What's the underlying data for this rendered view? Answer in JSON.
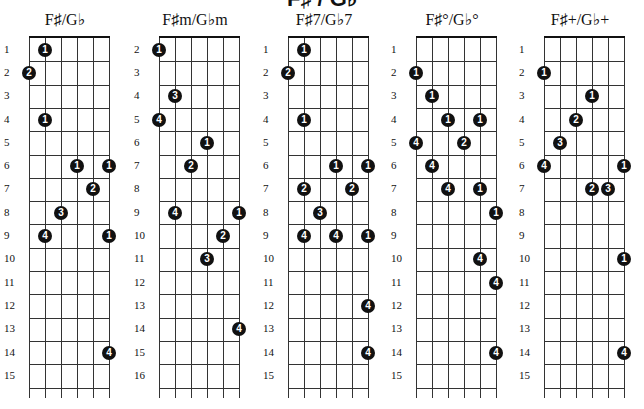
{
  "page": {
    "heading_cut": "F♯ / G♭"
  },
  "charts": [
    {
      "title": "F♯/G♭",
      "left": 0,
      "board_left": 29,
      "start_fret": 1,
      "fret_labels": [
        "1",
        "2",
        "3",
        "4",
        "5",
        "6",
        "7",
        "8",
        "9",
        "10",
        "11",
        "12",
        "13",
        "14",
        "15"
      ],
      "dots": [
        {
          "fret": 1,
          "string": 1,
          "finger": "1"
        },
        {
          "fret": 2,
          "string": 0,
          "finger": "2"
        },
        {
          "fret": 4,
          "string": 1,
          "finger": "1"
        },
        {
          "fret": 6,
          "string": 3,
          "finger": "1"
        },
        {
          "fret": 6,
          "string": 5,
          "finger": "1"
        },
        {
          "fret": 7,
          "string": 4,
          "finger": "2"
        },
        {
          "fret": 8,
          "string": 2,
          "finger": "3"
        },
        {
          "fret": 9,
          "string": 1,
          "finger": "4"
        },
        {
          "fret": 9,
          "string": 5,
          "finger": "1"
        },
        {
          "fret": 14,
          "string": 5,
          "finger": "4"
        }
      ]
    },
    {
      "title": "F♯m/G♭m",
      "left": 130,
      "board_left": 159,
      "start_fret": 2,
      "fret_labels": [
        "2",
        "3",
        "4",
        "5",
        "6",
        "7",
        "8",
        "9",
        "10",
        "11",
        "12",
        "13",
        "14",
        "15",
        "16"
      ],
      "dots": [
        {
          "fret": 2,
          "string": 0,
          "finger": "1"
        },
        {
          "fret": 4,
          "string": 1,
          "finger": "3"
        },
        {
          "fret": 5,
          "string": 0,
          "finger": "4"
        },
        {
          "fret": 6,
          "string": 3,
          "finger": "1"
        },
        {
          "fret": 7,
          "string": 2,
          "finger": "2"
        },
        {
          "fret": 9,
          "string": 1,
          "finger": "4"
        },
        {
          "fret": 9,
          "string": 5,
          "finger": "1"
        },
        {
          "fret": 10,
          "string": 4,
          "finger": "2"
        },
        {
          "fret": 11,
          "string": 3,
          "finger": "3"
        },
        {
          "fret": 14,
          "string": 5,
          "finger": "4"
        }
      ]
    },
    {
      "title": "F♯7/G♭7",
      "left": 259,
      "board_left": 288,
      "start_fret": 1,
      "fret_labels": [
        "1",
        "2",
        "3",
        "4",
        "5",
        "6",
        "7",
        "8",
        "9",
        "10",
        "11",
        "12",
        "13",
        "14",
        "15"
      ],
      "dots": [
        {
          "fret": 1,
          "string": 1,
          "finger": "1"
        },
        {
          "fret": 2,
          "string": 0,
          "finger": "2"
        },
        {
          "fret": 4,
          "string": 1,
          "finger": "1"
        },
        {
          "fret": 6,
          "string": 3,
          "finger": "1"
        },
        {
          "fret": 6,
          "string": 5,
          "finger": "1"
        },
        {
          "fret": 7,
          "string": 1,
          "finger": "2"
        },
        {
          "fret": 7,
          "string": 4,
          "finger": "2"
        },
        {
          "fret": 8,
          "string": 2,
          "finger": "3"
        },
        {
          "fret": 9,
          "string": 1,
          "finger": "4"
        },
        {
          "fret": 9,
          "string": 3,
          "finger": "4"
        },
        {
          "fret": 9,
          "string": 5,
          "finger": "1"
        },
        {
          "fret": 12,
          "string": 5,
          "finger": "4"
        },
        {
          "fret": 14,
          "string": 5,
          "finger": "4"
        }
      ]
    },
    {
      "title": "F♯°/G♭°",
      "left": 387,
      "board_left": 416,
      "start_fret": 1,
      "fret_labels": [
        "1",
        "2",
        "3",
        "4",
        "5",
        "6",
        "7",
        "8",
        "9",
        "10",
        "11",
        "12",
        "13",
        "14",
        "15"
      ],
      "dots": [
        {
          "fret": 2,
          "string": 0,
          "finger": "1"
        },
        {
          "fret": 3,
          "string": 1,
          "finger": "1"
        },
        {
          "fret": 4,
          "string": 2,
          "finger": "1"
        },
        {
          "fret": 4,
          "string": 4,
          "finger": "1"
        },
        {
          "fret": 5,
          "string": 0,
          "finger": "4"
        },
        {
          "fret": 5,
          "string": 3,
          "finger": "2"
        },
        {
          "fret": 6,
          "string": 1,
          "finger": "4"
        },
        {
          "fret": 7,
          "string": 2,
          "finger": "4"
        },
        {
          "fret": 7,
          "string": 4,
          "finger": "1"
        },
        {
          "fret": 8,
          "string": 5,
          "finger": "1"
        },
        {
          "fret": 10,
          "string": 4,
          "finger": "4"
        },
        {
          "fret": 11,
          "string": 5,
          "finger": "4"
        },
        {
          "fret": 14,
          "string": 5,
          "finger": "4"
        }
      ]
    },
    {
      "title": "F♯+/G♭+",
      "left": 515,
      "board_left": 544,
      "start_fret": 1,
      "fret_labels": [
        "1",
        "2",
        "3",
        "4",
        "5",
        "6",
        "7",
        "8",
        "9",
        "10",
        "11",
        "12",
        "13",
        "14",
        "15"
      ],
      "dots": [
        {
          "fret": 2,
          "string": 0,
          "finger": "1"
        },
        {
          "fret": 3,
          "string": 3,
          "finger": "1"
        },
        {
          "fret": 4,
          "string": 2,
          "finger": "2"
        },
        {
          "fret": 5,
          "string": 1,
          "finger": "3"
        },
        {
          "fret": 6,
          "string": 0,
          "finger": "4"
        },
        {
          "fret": 6,
          "string": 5,
          "finger": "1"
        },
        {
          "fret": 7,
          "string": 3,
          "finger": "2"
        },
        {
          "fret": 7,
          "string": 4,
          "finger": "3"
        },
        {
          "fret": 10,
          "string": 5,
          "finger": "1"
        },
        {
          "fret": 14,
          "string": 5,
          "finger": "4"
        }
      ]
    }
  ]
}
